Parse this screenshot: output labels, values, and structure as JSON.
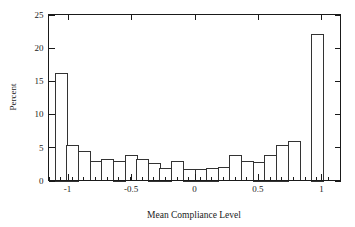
{
  "chart_data": {
    "type": "bar",
    "title": "",
    "subtitle": "",
    "xlabel": "Mean Compliance Level",
    "ylabel": "Percent",
    "xlim": [
      -1.15,
      1.15
    ],
    "ylim": [
      0,
      25
    ],
    "grid": false,
    "legend": null,
    "bin_width": 0.0917,
    "x_tick_labels": [
      "-1",
      "-0.5",
      "0",
      "0.5",
      "1"
    ],
    "x_tick_values": [
      -1,
      -0.5,
      0,
      0.5,
      1
    ],
    "y_tick_labels": [
      "0",
      "5",
      "10",
      "15",
      "20",
      "25"
    ],
    "y_tick_values": [
      0,
      5,
      10,
      15,
      20,
      25
    ],
    "bin_centers": [
      -1.055,
      -0.963,
      -0.871,
      -0.78,
      -0.688,
      -0.596,
      -0.505,
      -0.413,
      -0.321,
      -0.23,
      -0.138,
      -0.046,
      0.046,
      0.138,
      0.23,
      0.321,
      0.413,
      0.505,
      0.596,
      0.688,
      0.78,
      0.871,
      0.963,
      1.055
    ],
    "categories": [
      "-1.06",
      "-0.96",
      "-0.87",
      "-0.78",
      "-0.69",
      "-0.60",
      "-0.50",
      "-0.41",
      "-0.32",
      "-0.23",
      "-0.14",
      "-0.05",
      "0.05",
      "0.14",
      "0.23",
      "0.32",
      "0.41",
      "0.50",
      "0.60",
      "0.69",
      "0.78",
      "0.87",
      "0.96",
      "1.06"
    ],
    "values": [
      16.2,
      5.4,
      4.4,
      2.9,
      3.2,
      3.0,
      3.8,
      3.2,
      2.7,
      1.9,
      2.9,
      1.8,
      1.8,
      1.9,
      3.8,
      2.9,
      2.8,
      3.9,
      5.4,
      5.9,
      22.1,
      0,
      0,
      0
    ],
    "bars": [
      {
        "center": -1.055,
        "value": 16.2
      },
      {
        "center": -0.963,
        "value": 5.4
      },
      {
        "center": -0.871,
        "value": 4.4
      },
      {
        "center": -0.78,
        "value": 2.9
      },
      {
        "center": -0.688,
        "value": 3.2
      },
      {
        "center": -0.596,
        "value": 3.0
      },
      {
        "center": -0.505,
        "value": 3.8
      },
      {
        "center": -0.413,
        "value": 3.2
      },
      {
        "center": -0.321,
        "value": 2.7
      },
      {
        "center": -0.23,
        "value": 1.9
      },
      {
        "center": -0.138,
        "value": 2.9
      },
      {
        "center": -0.046,
        "value": 1.8
      },
      {
        "center": 0.046,
        "value": 1.8
      },
      {
        "center": 0.138,
        "value": 1.9
      },
      {
        "center": 0.23,
        "value": 2.0
      },
      {
        "center": 0.321,
        "value": 3.8
      },
      {
        "center": 0.413,
        "value": 2.9
      },
      {
        "center": 0.505,
        "value": 2.8
      },
      {
        "center": 0.596,
        "value": 3.9
      },
      {
        "center": 0.688,
        "value": 5.4
      },
      {
        "center": 0.78,
        "value": 5.9
      },
      {
        "center": 0.963,
        "value": 22.1
      }
    ],
    "colors": {
      "bar_fill": "#ffffff",
      "bar_stroke": "#333333",
      "axis": "#1a1a1a",
      "background": "#ffffff"
    }
  }
}
